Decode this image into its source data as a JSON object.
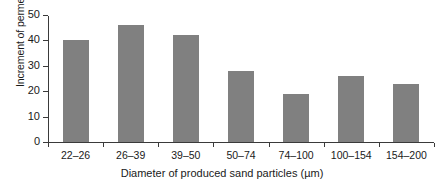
{
  "chart_data": {
    "type": "bar",
    "title": "",
    "xlabel": "Diameter of produced sand particles (µm)",
    "ylabel": "Increment of permeability (µm)",
    "categories": [
      "22–26",
      "26–39",
      "39–50",
      "50–74",
      "74–100",
      "100–154",
      "154–200"
    ],
    "values": [
      40,
      46,
      42,
      28,
      19,
      26,
      23
    ],
    "ylim": [
      0,
      50
    ],
    "yticks": [
      0,
      10,
      20,
      30,
      40,
      50
    ],
    "ytick_labels": [
      "0",
      "10",
      "20",
      "30",
      "40",
      "50"
    ],
    "grid": false,
    "legend": false,
    "bar_color": "#808080",
    "axis_color": "#3a3a3a"
  }
}
